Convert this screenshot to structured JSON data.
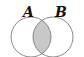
{
  "diagram": {
    "type": "venn",
    "sets": [
      {
        "label": "A",
        "cx": 31,
        "cy": 37,
        "r": 20
      },
      {
        "label": "B",
        "cx": 53,
        "cy": 37,
        "r": 20
      }
    ],
    "shaded_region": "A ∩ B",
    "colors": {
      "stroke": "#888888",
      "shade": "#c8c8c8",
      "label": "#111111",
      "background": "#ffffff"
    }
  }
}
